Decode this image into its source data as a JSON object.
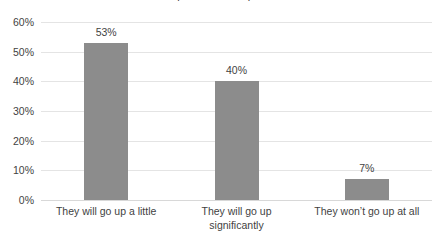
{
  "chart_data": {
    "type": "bar",
    "title": "",
    "title_clipped": "Expectations for prices",
    "xlabel": "",
    "ylabel": "",
    "categories": [
      "They will go up a little",
      "They will go up significantly",
      "They won’t go up at all"
    ],
    "category_lines": [
      [
        "They will go up a little"
      ],
      [
        "They will go up",
        "significantly"
      ],
      [
        "They won’t go up at all"
      ]
    ],
    "values": [
      53,
      40,
      7
    ],
    "value_labels": [
      "53%",
      "40%",
      "7%"
    ],
    "ylim": [
      0,
      60
    ],
    "ytick_values": [
      60,
      50,
      40,
      30,
      20,
      10,
      0
    ],
    "ytick_labels": [
      "60%",
      "50%",
      "40%",
      "30%",
      "20%",
      "10%",
      "0%"
    ],
    "grid": true,
    "legend": false,
    "legend_position": "none",
    "bar_color": "#8c8c8c",
    "gridline_color": "#e4e4e4",
    "baseline_color": "#d8d8d8",
    "text_color": "#3f3f3f",
    "background_color": "#ffffff"
  }
}
